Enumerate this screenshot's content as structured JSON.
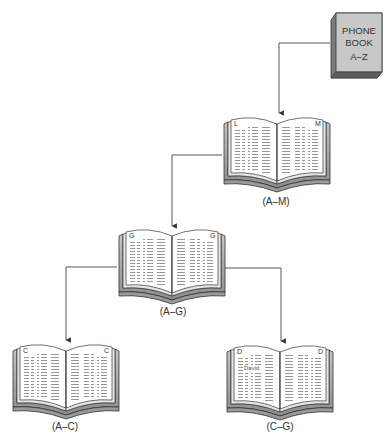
{
  "phone_book": {
    "lines": [
      "PHONE",
      "BOOK",
      "A–Z"
    ],
    "cover_color": "#c8c8c8",
    "edge_color": "#7a7a7a"
  },
  "books": [
    {
      "id": "book-am",
      "left_letter": "L",
      "right_letter": "M",
      "label": "(A–M)"
    },
    {
      "id": "book-ag",
      "left_letter": "G",
      "right_letter": "G",
      "label": "(A–G)"
    },
    {
      "id": "book-ac",
      "left_letter": "C",
      "right_letter": "C",
      "label": "(A–C)"
    },
    {
      "id": "book-cg",
      "left_letter": "D",
      "right_letter": "D",
      "label": "(C–G)",
      "highlighted_entry": "David"
    }
  ],
  "colors": {
    "line": "#444444",
    "page": "#ffffff",
    "page_lines": "#7a7a7a",
    "cover": "#b5b5b5",
    "cover_dark": "#7f7f7f"
  }
}
